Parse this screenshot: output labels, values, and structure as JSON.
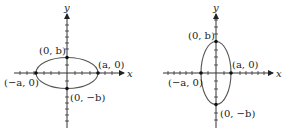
{
  "diagrams": [
    {
      "name": "horizontal-ellipse",
      "x_axis_label": "x",
      "y_axis_label": "y",
      "points": {
        "top": "(0, b)",
        "bottom": "(0, −b)",
        "right": "(a, 0)",
        "left": "(−a, 0)"
      }
    },
    {
      "name": "vertical-ellipse",
      "x_axis_label": "x",
      "y_axis_label": "y",
      "points": {
        "top": "(0, b)",
        "bottom": "(0, −b)",
        "right": "(a, 0)",
        "left": "(−a, 0)"
      }
    }
  ],
  "colors": {
    "stroke": "#333333",
    "ellipse": "#555555"
  }
}
